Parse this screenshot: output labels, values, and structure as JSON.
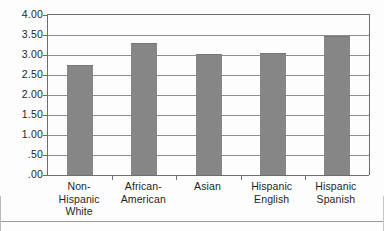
{
  "chart_data": {
    "type": "bar",
    "title": "",
    "subtitle": "",
    "xlabel": "",
    "ylabel": "",
    "categories": [
      "Non-Hispanic White",
      "African-American",
      "Asian",
      "Hispanic English",
      "Hispanic Spanish"
    ],
    "category_lines": [
      [
        "Non-Hispanic",
        "White"
      ],
      [
        "African-",
        "American"
      ],
      [
        "Asian",
        ""
      ],
      [
        "Hispanic",
        "English"
      ],
      [
        "Hispanic",
        "Spanish"
      ]
    ],
    "values": [
      2.75,
      3.3,
      3.03,
      3.05,
      3.47
    ],
    "ylim": [
      0.0,
      4.0
    ],
    "ytick_values": [
      4.0,
      3.5,
      3.0,
      2.5,
      2.0,
      1.5,
      1.0,
      0.5,
      0.0
    ],
    "ytick_labels": [
      "4.00",
      "3.50",
      "3.00",
      "2.50",
      "2.00",
      "1.50",
      "1.00",
      ".50",
      ".00"
    ],
    "grid": true,
    "legend": false,
    "legend_position": "none",
    "bar_color": "#868686",
    "axis_color": "#6e6e6e",
    "grid_color": "#8d8d8d",
    "background_color": "#fdfdfd"
  }
}
